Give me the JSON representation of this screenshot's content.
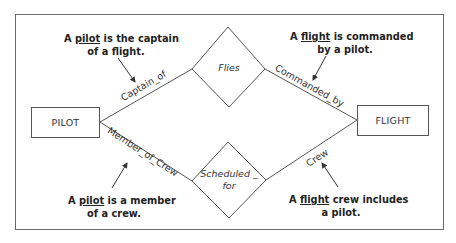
{
  "diagram": {
    "type": "entity-relationship",
    "entities": [
      {
        "id": "pilot",
        "label": "PILOT"
      },
      {
        "id": "flight",
        "label": "FLIGHT"
      }
    ],
    "relationships": [
      {
        "id": "flies",
        "label": "Flies",
        "from": "pilot",
        "to": "flight",
        "role_left": "Captain_of",
        "role_right": "Commanded_by"
      },
      {
        "id": "scheduled_for",
        "label_line1": "Scheduled _",
        "label_line2": "for",
        "from": "pilot",
        "to": "flight",
        "role_left": "Member_of_Crew",
        "role_right": "Crew"
      }
    ],
    "notes": {
      "captain": {
        "pre": "A ",
        "key": "pilot",
        "post": " is the captain",
        "line2": "of a flight."
      },
      "commanded": {
        "pre": "A ",
        "key": "flight",
        "post": " is commanded",
        "line2": "by a pilot."
      },
      "member": {
        "pre": "A ",
        "key": "pilot",
        "post": " is a member",
        "line2": "of a crew."
      },
      "crew": {
        "pre": "A ",
        "key": "flight",
        "post": " crew includes",
        "line2": "a pilot."
      }
    },
    "colors": {
      "line": "#555555",
      "frame": "#6a6a6a",
      "text": "#222222"
    }
  }
}
